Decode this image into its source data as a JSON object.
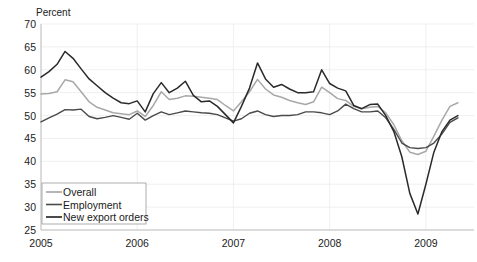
{
  "chart_data": {
    "type": "line",
    "title": "",
    "ylabel": "Percent",
    "xlabel": "",
    "ylim": [
      25,
      70
    ],
    "yticks": [
      25,
      30,
      35,
      40,
      45,
      50,
      55,
      60,
      65,
      70
    ],
    "ytick_labels": [
      "25",
      "30",
      "35",
      "40",
      "45",
      "50",
      "55",
      "60",
      "65",
      "70"
    ],
    "xlim": [
      2005.0,
      2009.5
    ],
    "xticks": [
      2005,
      2006,
      2007,
      2008,
      2009
    ],
    "xtick_labels": [
      "2005",
      "2006",
      "2007",
      "2008",
      "2009"
    ],
    "grid": true,
    "legend_position": "lower-left",
    "x": [
      2005.0,
      2005.083,
      2005.167,
      2005.25,
      2005.333,
      2005.417,
      2005.5,
      2005.583,
      2005.667,
      2005.75,
      2005.833,
      2005.917,
      2006.0,
      2006.083,
      2006.167,
      2006.25,
      2006.333,
      2006.417,
      2006.5,
      2006.583,
      2006.667,
      2006.75,
      2006.833,
      2006.917,
      2007.0,
      2007.083,
      2007.167,
      2007.25,
      2007.333,
      2007.417,
      2007.5,
      2007.583,
      2007.667,
      2007.75,
      2007.833,
      2007.917,
      2008.0,
      2008.083,
      2008.167,
      2008.25,
      2008.333,
      2008.417,
      2008.5,
      2008.583,
      2008.667,
      2008.75,
      2008.833,
      2008.917,
      2009.0,
      2009.083,
      2009.167,
      2009.25,
      2009.333
    ],
    "series": [
      {
        "name": "Overall",
        "color": "#a8a8a8",
        "width": 1.5,
        "values": [
          54.7,
          54.8,
          55.2,
          57.8,
          57.4,
          55.2,
          53.0,
          51.8,
          51.2,
          50.6,
          50.4,
          50.2,
          51.0,
          49.8,
          52.2,
          55.2,
          53.5,
          53.8,
          54.3,
          54.2,
          54.0,
          53.8,
          53.5,
          52.2,
          51.0,
          53.0,
          55.2,
          57.9,
          55.8,
          54.5,
          54.0,
          53.3,
          52.8,
          52.4,
          53.0,
          56.2,
          55.0,
          53.7,
          53.3,
          52.0,
          51.5,
          51.8,
          52.0,
          50.6,
          48.0,
          44.5,
          42.0,
          41.5,
          42.2,
          45.5,
          49.0,
          52.0,
          52.8
        ]
      },
      {
        "name": "Employment",
        "color": "#4a4a4a",
        "width": 1.4,
        "values": [
          48.6,
          49.5,
          50.3,
          51.3,
          51.2,
          51.4,
          49.8,
          49.3,
          49.6,
          50.0,
          49.6,
          49.2,
          50.5,
          49.0,
          50.0,
          50.8,
          50.2,
          50.6,
          51.0,
          50.8,
          50.6,
          50.5,
          50.2,
          49.5,
          48.8,
          49.3,
          50.5,
          51.0,
          50.2,
          49.8,
          50.0,
          50.0,
          50.2,
          50.8,
          50.8,
          50.6,
          50.2,
          51.0,
          52.5,
          51.5,
          50.8,
          50.8,
          51.0,
          49.5,
          47.0,
          44.0,
          43.0,
          42.8,
          43.0,
          44.0,
          46.0,
          48.5,
          49.5
        ]
      },
      {
        "name": "New export orders",
        "color": "#2a2a2a",
        "width": 1.5,
        "values": [
          58.4,
          59.6,
          61.2,
          64.0,
          62.5,
          60.2,
          58.0,
          56.5,
          55.0,
          53.8,
          52.8,
          52.6,
          53.2,
          50.8,
          54.8,
          57.2,
          55.0,
          56.0,
          57.5,
          54.4,
          53.0,
          53.2,
          52.0,
          50.2,
          48.4,
          52.0,
          56.0,
          61.5,
          58.0,
          56.2,
          56.8,
          55.8,
          55.0,
          55.0,
          55.2,
          60.0,
          57.0,
          56.0,
          55.4,
          52.2,
          51.5,
          52.4,
          52.5,
          50.0,
          46.5,
          41.0,
          33.0,
          28.5,
          35.0,
          42.0,
          46.5,
          49.0,
          50.0
        ]
      }
    ]
  },
  "legend": {
    "items": [
      {
        "label": "Overall"
      },
      {
        "label": "Employment"
      },
      {
        "label": "New export orders"
      }
    ]
  }
}
